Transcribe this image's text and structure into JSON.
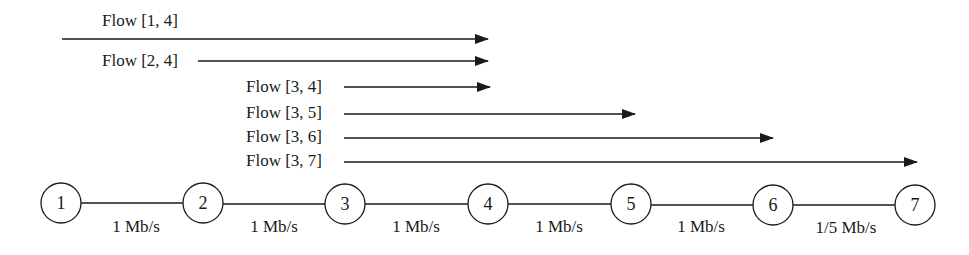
{
  "diagram": {
    "flows": [
      {
        "label": "Flow [1,  4]",
        "from": 1,
        "to": 4
      },
      {
        "label": "Flow [2, 4]",
        "from": 2,
        "to": 4
      },
      {
        "label": "Flow [3, 4]",
        "from": 3,
        "to": 4
      },
      {
        "label": "Flow [3, 5]",
        "from": 3,
        "to": 5
      },
      {
        "label": "Flow [3, 6]",
        "from": 3,
        "to": 6
      },
      {
        "label": "Flow [3, 7]",
        "from": 3,
        "to": 7
      }
    ],
    "nodes": [
      {
        "label": "1"
      },
      {
        "label": "2"
      },
      {
        "label": "3"
      },
      {
        "label": "4"
      },
      {
        "label": "5"
      },
      {
        "label": "6"
      },
      {
        "label": "7"
      }
    ],
    "links": [
      {
        "label": "1 Mb/s"
      },
      {
        "label": "1 Mb/s"
      },
      {
        "label": "1 Mb/s"
      },
      {
        "label": "1 Mb/s"
      },
      {
        "label": "1 Mb/s"
      },
      {
        "label": "1/5 Mb/s"
      }
    ],
    "colors": {
      "stroke": "#1a1a1a",
      "background": "#ffffff"
    }
  }
}
